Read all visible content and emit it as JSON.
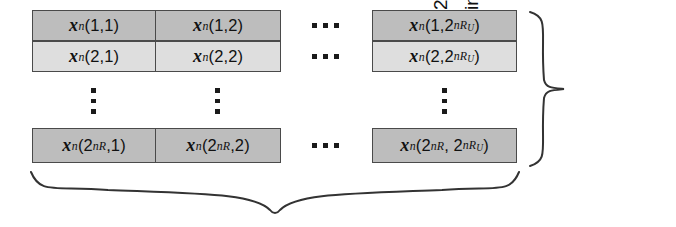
{
  "figure": {
    "type": "codebook-grid-diagram",
    "title": "",
    "colors": {
      "cell_border": "#4a4a4a",
      "row_top_fill": "#bdbdbd",
      "row_second_fill": "#dedede",
      "row_last_fill": "#bdbdbd",
      "text": "#111111",
      "brace_stroke": "#333333",
      "background": "#ffffff"
    },
    "grid": {
      "row_labels": [
        "1",
        "2",
        "2^{nR}"
      ],
      "column_labels": [
        "1",
        "2",
        "2^{nR_U}"
      ],
      "rows": [
        {
          "shade": "dark",
          "cells": [
            {
              "base": "x",
              "sup": "n",
              "args": "(1,1)",
              "arg1": "1",
              "arg2": "1"
            },
            {
              "base": "x",
              "sup": "n",
              "args": "(1,2)",
              "arg1": "1",
              "arg2": "2"
            },
            {
              "base": "x",
              "sup": "n",
              "args": "(1,2^{nRU})",
              "arg1": "1",
              "arg2": "2^{nR_U}"
            }
          ]
        },
        {
          "shade": "light",
          "cells": [
            {
              "base": "x",
              "sup": "n",
              "args": "(2,1)",
              "arg1": "2",
              "arg2": "1"
            },
            {
              "base": "x",
              "sup": "n",
              "args": "(2,2)",
              "arg1": "2",
              "arg2": "2"
            },
            {
              "base": "x",
              "sup": "n",
              "args": "(2,2^{nRU})",
              "arg1": "2",
              "arg2": "2^{nR_U}"
            }
          ]
        },
        {
          "shade": "dark",
          "cells": [
            {
              "base": "x",
              "sup": "n",
              "args": "(2^{nR},1)",
              "arg1": "2^{nR}",
              "arg2": "1"
            },
            {
              "base": "x",
              "sup": "n",
              "args": "(2^{nR},2)",
              "arg1": "2^{nR}",
              "arg2": "2"
            },
            {
              "base": "x",
              "sup": "n",
              "args": "(2^{nR}, 2^{nRU})",
              "arg1": "2^{nR}",
              "arg2": "2^{nR_U}"
            }
          ]
        }
      ]
    },
    "ellipses": {
      "horizontal_glyph": "...",
      "vertical_glyph": "⋮",
      "horizontal_count": 3,
      "vertical_count": 3
    },
    "right_caption": {
      "line1_prefix": "2",
      "line1_sup": "nR",
      "line1_rest": " subcodes",
      "line2_prefix": "indexed by ",
      "line2_symbol": "M",
      "full_text": "2^{nR} subcodes indexed by M",
      "orientation": "rotated-90-ccw"
    },
    "bottom_brace": {
      "label": "",
      "span_description": "spans all columns of the codebook grid",
      "direction": "down"
    },
    "right_brace": {
      "span_description": "spans all rows of the codebook grid",
      "direction": "right"
    }
  }
}
